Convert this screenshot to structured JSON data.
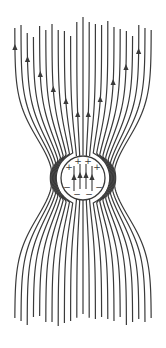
{
  "diagram": {
    "title": "Field lines around a conducting sphere in a uniform electric field",
    "canvas": {
      "width": 166,
      "height": 348,
      "background": "#ffffff"
    },
    "line_color": "#3a3a3a",
    "line_width": 1.2,
    "sphere": {
      "cx": 83,
      "cy": 178,
      "r": 22,
      "stroke": "#3a3a3a"
    },
    "field_direction": "up",
    "num_lines": 23,
    "line_spacing_far": 6.2,
    "pinch_strength": 0.55,
    "top_ends": [
      28,
      25,
      33,
      37,
      26,
      30,
      24,
      30,
      31,
      36,
      22,
      17,
      22,
      24,
      25,
      21,
      27,
      29,
      31,
      36,
      25,
      28,
      30
    ],
    "bottom_ends": [
      318,
      322,
      326,
      318,
      316,
      322,
      322,
      327,
      324,
      322,
      318,
      314,
      318,
      320,
      317,
      320,
      322,
      318,
      326,
      322,
      320,
      322,
      318
    ],
    "arrows": [
      {
        "line": 0,
        "y": 48
      },
      {
        "line": 2,
        "y": 60
      },
      {
        "line": 4,
        "y": 75
      },
      {
        "line": 6,
        "y": 90
      },
      {
        "line": 8,
        "y": 102
      },
      {
        "line": 10,
        "y": 115
      },
      {
        "line": 12,
        "y": 115
      },
      {
        "line": 14,
        "y": 100
      },
      {
        "line": 16,
        "y": 83
      },
      {
        "line": 18,
        "y": 68
      },
      {
        "line": 20,
        "y": 52
      }
    ],
    "inner_arrows": [
      {
        "x": 74,
        "y": 178
      },
      {
        "x": 80,
        "y": 176
      },
      {
        "x": 86,
        "y": 176
      },
      {
        "x": 92,
        "y": 178
      }
    ],
    "charges_positive": [
      {
        "x": 69,
        "y": 167,
        "label": "+"
      },
      {
        "x": 78,
        "y": 161,
        "label": "+"
      },
      {
        "x": 88,
        "y": 161,
        "label": "+"
      },
      {
        "x": 97,
        "y": 167,
        "label": "+"
      }
    ],
    "charges_negative": [
      {
        "x": 67,
        "y": 187,
        "label": "−"
      },
      {
        "x": 77,
        "y": 194,
        "label": "−"
      },
      {
        "x": 89,
        "y": 194,
        "label": "−"
      },
      {
        "x": 99,
        "y": 187,
        "label": "−"
      }
    ]
  }
}
